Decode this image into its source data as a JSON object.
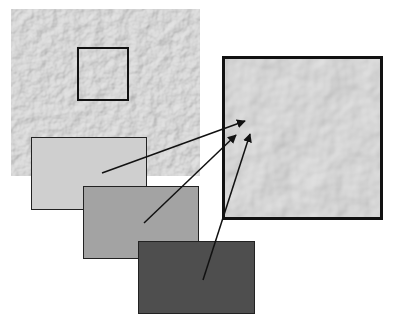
{
  "diagram": {
    "texture_panel": {
      "label": "",
      "fill": "#a8a8a8",
      "selection_box": {
        "x": 77,
        "y": 47,
        "w": 52,
        "h": 54
      }
    },
    "zoom_panel": {
      "label": "",
      "fill": "#b4b4b4",
      "border": "#111111"
    },
    "swatches": [
      {
        "name": "light",
        "fill": "#cfcfcf",
        "arrow_from": [
          102,
          173
        ],
        "arrow_to": [
          245,
          121
        ]
      },
      {
        "name": "medium",
        "fill": "#a3a3a3",
        "arrow_from": [
          144,
          223
        ],
        "arrow_to": [
          236,
          135
        ]
      },
      {
        "name": "dark",
        "fill": "#4e4e4e",
        "arrow_from": [
          203,
          280
        ],
        "arrow_to": [
          250,
          134
        ]
      }
    ],
    "arrow_color": "#111111"
  }
}
